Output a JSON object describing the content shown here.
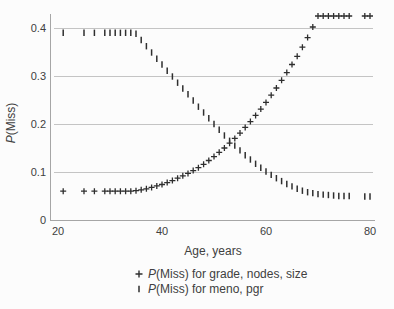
{
  "figure_background": "#fcfcfc",
  "axes": {
    "x_label": "Age, years",
    "y_label_italic": "P",
    "y_label_rest": "(Miss)"
  },
  "legend": {
    "items": [
      {
        "marker": "plus-icon",
        "label_italic": "P",
        "label_rest": "(Miss) for grade, nodes, size"
      },
      {
        "marker": "vbar-icon",
        "label_italic": "P",
        "label_rest": "(Miss) for meno, pgr"
      }
    ]
  },
  "chart_data": {
    "type": "scatter",
    "title": "",
    "xlabel": "Age, years",
    "ylabel": "P(Miss)",
    "xlim": [
      18.5,
      81
    ],
    "ylim": [
      0,
      0.44
    ],
    "x_ticks": [
      20,
      40,
      60,
      80
    ],
    "y_ticks": [
      0,
      0.1,
      0.2,
      0.3,
      0.4
    ],
    "grid": "horizontal-gridlines-at-y-ticks",
    "legend_position": "bottom",
    "x": [
      21,
      25,
      27,
      29,
      30,
      31,
      32,
      33,
      34,
      35,
      36,
      37,
      38,
      39,
      40,
      41,
      42,
      43,
      44,
      45,
      46,
      47,
      48,
      49,
      50,
      51,
      52,
      53,
      54,
      55,
      56,
      57,
      58,
      59,
      60,
      61,
      62,
      63,
      64,
      65,
      66,
      67,
      68,
      69,
      70,
      71,
      72,
      73,
      74,
      75,
      76,
      79,
      80
    ],
    "series": [
      {
        "name": "P(Miss) for grade, nodes, size",
        "marker": "plus",
        "values": [
          0.06,
          0.06,
          0.06,
          0.06,
          0.06,
          0.06,
          0.06,
          0.06,
          0.06,
          0.061,
          0.063,
          0.065,
          0.068,
          0.071,
          0.074,
          0.078,
          0.082,
          0.087,
          0.092,
          0.097,
          0.103,
          0.109,
          0.116,
          0.124,
          0.132,
          0.141,
          0.15,
          0.16,
          0.17,
          0.181,
          0.193,
          0.205,
          0.218,
          0.231,
          0.245,
          0.26,
          0.275,
          0.291,
          0.307,
          0.324,
          0.341,
          0.36,
          0.38,
          0.402,
          0.425,
          0.425,
          0.425,
          0.425,
          0.425,
          0.425,
          0.425,
          0.425,
          0.425
        ]
      },
      {
        "name": "P(Miss) for meno, pgr",
        "marker": "vbar",
        "values": [
          0.39,
          0.39,
          0.39,
          0.39,
          0.39,
          0.39,
          0.39,
          0.39,
          0.39,
          0.388,
          0.375,
          0.362,
          0.349,
          0.336,
          0.324,
          0.311,
          0.299,
          0.286,
          0.274,
          0.262,
          0.249,
          0.236,
          0.224,
          0.212,
          0.2,
          0.188,
          0.176,
          0.165,
          0.155,
          0.145,
          0.135,
          0.126,
          0.117,
          0.109,
          0.101,
          0.094,
          0.087,
          0.081,
          0.075,
          0.07,
          0.065,
          0.061,
          0.058,
          0.056,
          0.054,
          0.053,
          0.052,
          0.051,
          0.05,
          0.05,
          0.05,
          0.049,
          0.049
        ]
      }
    ],
    "colors": {
      "marker": "#2e2e2e",
      "grid": "#c4c4c4",
      "axis": "#a6a6a6",
      "text": "#404040",
      "background": "#fcfcfc"
    }
  }
}
